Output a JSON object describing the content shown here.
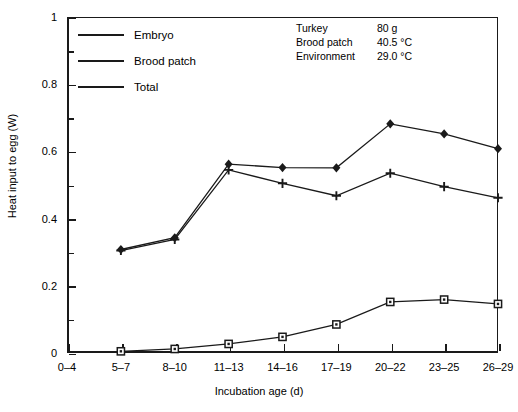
{
  "chart_data": {
    "type": "line",
    "title": "",
    "xlabel": "Incubation age (d)",
    "ylabel": "Heat input to egg (W)",
    "categories": [
      "0–4",
      "5–7",
      "8–10",
      "11–13",
      "14–16",
      "17–19",
      "20–22",
      "23–25",
      "26–29"
    ],
    "ylim": [
      0,
      1
    ],
    "xlim": [
      0,
      8
    ],
    "ytick_labels": [
      "0",
      "0.2",
      "0.4",
      "0.6",
      "0.8",
      "1"
    ],
    "ytick_values": [
      0,
      0.2,
      0.4,
      0.6,
      0.8,
      1
    ],
    "yminor_ticks": [
      0.1,
      0.3,
      0.5,
      0.7,
      0.9
    ],
    "grid": false,
    "legend_position": "upper left",
    "series": [
      {
        "name": "Embryo",
        "marker": "open-square",
        "x": [
          "5–7",
          "8–10",
          "11–13",
          "14–16",
          "17–19",
          "20–22",
          "23–25",
          "26–29"
        ],
        "values": [
          0.005,
          0.012,
          0.027,
          0.048,
          0.085,
          0.152,
          0.159,
          0.146
        ]
      },
      {
        "name": "Brood patch",
        "marker": "plus",
        "x": [
          "5–7",
          "8–10",
          "11–13",
          "14–16",
          "17–19",
          "20–22",
          "23–25",
          "26–29"
        ],
        "values": [
          0.305,
          0.338,
          0.545,
          0.505,
          0.468,
          0.535,
          0.495,
          0.462
        ]
      },
      {
        "name": "Total",
        "marker": "filled-diamond",
        "x": [
          "5–7",
          "8–10",
          "11–13",
          "14–16",
          "17–19",
          "20–22",
          "23–25",
          "26–29"
        ],
        "values": [
          0.308,
          0.343,
          0.562,
          0.552,
          0.551,
          0.682,
          0.652,
          0.608
        ]
      }
    ],
    "annotations": [
      {
        "label": "Turkey",
        "value": "80 g"
      },
      {
        "label": "Brood patch",
        "value": "40.5 °C"
      },
      {
        "label": "Environment",
        "value": "29.0 °C"
      }
    ]
  },
  "legend": {
    "items": [
      {
        "label": "Embryo",
        "marker": "open-square"
      },
      {
        "label": "Brood patch",
        "marker": "plus"
      },
      {
        "label": "Total",
        "marker": "filled-diamond"
      }
    ]
  },
  "colors": {
    "ink": "#1a1a1a",
    "background": "#ffffff"
  }
}
